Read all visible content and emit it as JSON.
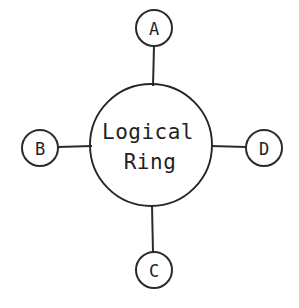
{
  "diagram": {
    "type": "network-topology",
    "background_color": "#ffffff",
    "stroke_color": "#2b2b2b",
    "ring": {
      "label_line1": "Logical",
      "label_line2": "Ring",
      "center_x": 151,
      "center_y": 145,
      "radius": 61
    },
    "nodes": [
      {
        "id": "A",
        "label": "A",
        "position": "top",
        "cx": 154,
        "cy": 28,
        "r": 18
      },
      {
        "id": "B",
        "label": "B",
        "position": "left",
        "cx": 40,
        "cy": 148,
        "r": 18
      },
      {
        "id": "D",
        "label": "D",
        "position": "right",
        "cx": 264,
        "cy": 148,
        "r": 18
      },
      {
        "id": "C",
        "label": "C",
        "position": "bottom",
        "cx": 154,
        "cy": 270,
        "r": 18
      }
    ],
    "edges": [
      {
        "from": "A",
        "to": "ring",
        "x1": 154,
        "y1": 46,
        "x2": 153,
        "y2": 86
      },
      {
        "from": "B",
        "to": "ring",
        "x1": 58,
        "y1": 147,
        "x2": 92,
        "y2": 146
      },
      {
        "from": "ring",
        "to": "D",
        "x1": 211,
        "y1": 146,
        "x2": 246,
        "y2": 147
      },
      {
        "from": "ring",
        "to": "C",
        "x1": 152,
        "y1": 205,
        "x2": 153,
        "y2": 252
      }
    ]
  }
}
